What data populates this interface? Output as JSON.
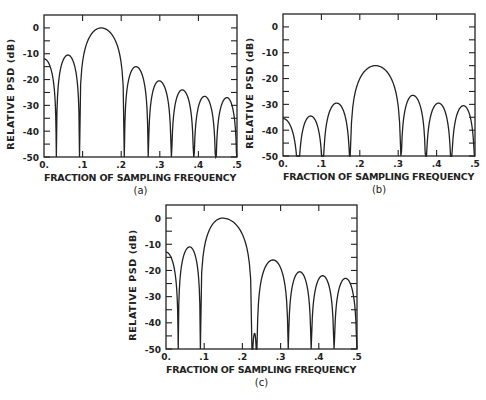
{
  "chart_data": [
    {
      "id": "a",
      "type": "line",
      "caption": "(a)",
      "xlabel": "FRACTION OF SAMPLING FREQUENCY",
      "ylabel": "RELATIVE PSD (dB)",
      "xlim": [
        0,
        0.5
      ],
      "ylim": [
        -50,
        5
      ],
      "xticks": [
        "0.",
        ".1",
        ".2",
        ".3",
        ".4",
        ".5"
      ],
      "yticks": [
        "0",
        "-10",
        "-20",
        "-30",
        "-40",
        "-50"
      ],
      "frame": {
        "x0": 44,
        "y0": 15,
        "x1": 237,
        "y1": 157
      },
      "lobes": [
        {
          "start": 0.0,
          "end": 0.032,
          "peak_x": 0.0,
          "peak_db": -12
        },
        {
          "start": 0.032,
          "end": 0.092,
          "peak_x": 0.062,
          "peak_db": -10.5
        },
        {
          "start": 0.092,
          "end": 0.208,
          "peak_x": 0.148,
          "peak_db": 0
        },
        {
          "start": 0.208,
          "end": 0.27,
          "peak_x": 0.238,
          "peak_db": -15
        },
        {
          "start": 0.27,
          "end": 0.33,
          "peak_x": 0.298,
          "peak_db": -20.5
        },
        {
          "start": 0.33,
          "end": 0.388,
          "peak_x": 0.358,
          "peak_db": -24
        },
        {
          "start": 0.388,
          "end": 0.445,
          "peak_x": 0.416,
          "peak_db": -26.5
        },
        {
          "start": 0.445,
          "end": 0.5,
          "peak_x": 0.474,
          "peak_db": -27
        }
      ]
    },
    {
      "id": "b",
      "type": "line",
      "caption": "(b)",
      "xlabel": "FRACTION OF SAMPLING FREQUENCY",
      "ylabel": "RELATIVE PSD (dB)",
      "xlim": [
        0,
        0.5
      ],
      "ylim": [
        -50,
        5
      ],
      "xticks": [
        "0.",
        ".1",
        ".2",
        ".3",
        ".4",
        ".5"
      ],
      "yticks": [
        "0",
        "-10",
        "-20",
        "-30",
        "-40",
        "-50"
      ],
      "frame": {
        "x0": 283,
        "y0": 14,
        "x1": 475,
        "y1": 156
      },
      "lobes": [
        {
          "start": 0.0,
          "end": 0.04,
          "peak_x": 0.0,
          "peak_db": -35.5
        },
        {
          "start": 0.04,
          "end": 0.104,
          "peak_x": 0.072,
          "peak_db": -34.5
        },
        {
          "start": 0.104,
          "end": 0.175,
          "peak_x": 0.14,
          "peak_db": -29.5
        },
        {
          "start": 0.175,
          "end": 0.307,
          "peak_x": 0.241,
          "peak_db": -15
        },
        {
          "start": 0.307,
          "end": 0.372,
          "peak_x": 0.338,
          "peak_db": -26.5
        },
        {
          "start": 0.372,
          "end": 0.438,
          "peak_x": 0.405,
          "peak_db": -29.5
        },
        {
          "start": 0.438,
          "end": 0.5,
          "peak_x": 0.47,
          "peak_db": -30.5
        }
      ]
    },
    {
      "id": "c",
      "type": "line",
      "caption": "(c)",
      "xlabel": "FRACTION OF SAMPLING FREQUENCY",
      "ylabel": "RELATIVE PSD (dB)",
      "xlim": [
        0,
        0.5
      ],
      "ylim": [
        -50,
        5
      ],
      "xticks": [
        "0.",
        ".1",
        ".2",
        ".3",
        ".4",
        ".5"
      ],
      "yticks": [
        "0",
        "-10",
        "-20",
        "-30",
        "-40",
        "-50"
      ],
      "frame": {
        "x0": 166,
        "y0": 205,
        "x1": 357,
        "y1": 349
      },
      "lobes": [
        {
          "start": 0.0,
          "end": 0.032,
          "peak_x": 0.0,
          "peak_db": -13
        },
        {
          "start": 0.032,
          "end": 0.09,
          "peak_x": 0.062,
          "peak_db": -11
        },
        {
          "start": 0.09,
          "end": 0.225,
          "peak_x": 0.148,
          "peak_db": 0
        },
        {
          "start": 0.225,
          "end": 0.238,
          "peak_x": 0.232,
          "peak_db": -44
        },
        {
          "start": 0.238,
          "end": 0.32,
          "peak_x": 0.28,
          "peak_db": -16
        },
        {
          "start": 0.32,
          "end": 0.38,
          "peak_x": 0.35,
          "peak_db": -20.5
        },
        {
          "start": 0.38,
          "end": 0.44,
          "peak_x": 0.41,
          "peak_db": -22
        },
        {
          "start": 0.44,
          "end": 0.5,
          "peak_x": 0.47,
          "peak_db": -23
        }
      ]
    }
  ]
}
